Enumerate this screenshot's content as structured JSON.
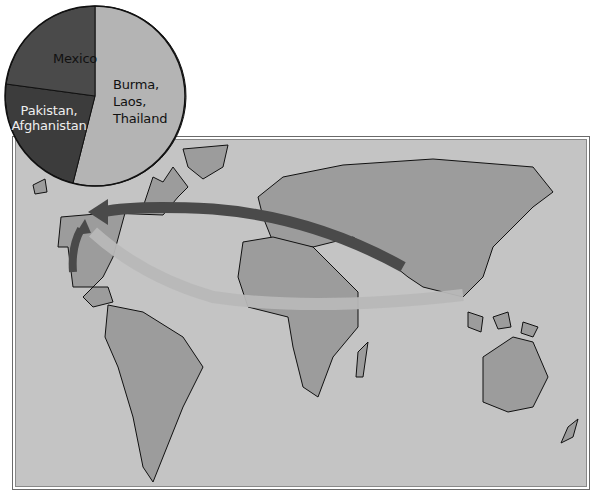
{
  "figure": {
    "type": "map_with_pie_inset",
    "pie_chart": {
      "slices": [
        {
          "label": "Burma, Laos, Thailand",
          "label_lines": [
            "Burma,",
            "Laos,",
            "Thailand"
          ],
          "approx_share_pct": 53,
          "color": "#b4b4b4"
        },
        {
          "label": "Pakistan, Afghanistan",
          "label_lines": [
            "Pakistan,",
            "Afghanistan"
          ],
          "approx_share_pct": 22,
          "color": "#3c3c3c"
        },
        {
          "label": "Mexico",
          "label_lines": [
            "Mexico"
          ],
          "approx_share_pct": 25,
          "color": "#4a4a4a"
        }
      ]
    },
    "map": {
      "land_color": "#9c9c9c",
      "ocean_color": "#c4c4c4",
      "arrows": [
        {
          "name": "southwest-asia-route",
          "from": "Pakistan/Afghanistan",
          "to": "United States",
          "color": "#4a4a4a"
        },
        {
          "name": "southeast-asia-route",
          "from": "Burma/Laos/Thailand",
          "to": "United States",
          "color": "#b8b8b8"
        },
        {
          "name": "mexico-route",
          "from": "Mexico",
          "to": "United States",
          "color": "#4a4a4a"
        }
      ]
    }
  }
}
